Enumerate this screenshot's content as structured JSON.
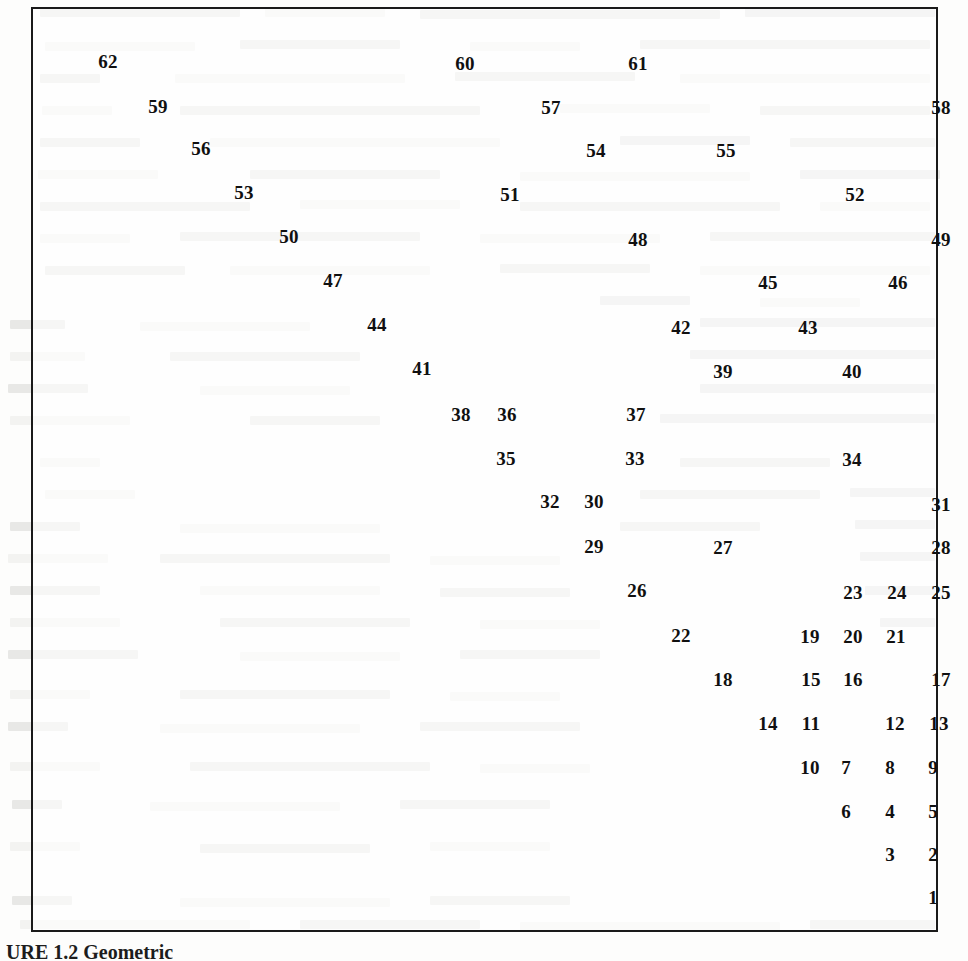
{
  "document": {
    "kind": "scanned-book-page",
    "figure_caption": "URE 1.2   Geometric"
  },
  "chart_data": {
    "type": "scatter",
    "title": "",
    "subtitle": "",
    "xlabel": "",
    "ylabel": "",
    "grid": false,
    "legend": null,
    "axis_ticks": [],
    "axis_visible": false,
    "frame": "full-box-border",
    "point_label_mode": "numeric-index",
    "n_points": 62,
    "xlim": [
      0,
      907
    ],
    "ylim": [
      0,
      925
    ],
    "note": "Each point is drawn only as its numeric index label; coordinates are label centers in pixels relative to the plot frame interior.",
    "points": [
      {
        "label": "62",
        "x": 75,
        "y": 52
      },
      {
        "label": "60",
        "x": 432,
        "y": 54
      },
      {
        "label": "61",
        "x": 605,
        "y": 54
      },
      {
        "label": "59",
        "x": 125,
        "y": 97
      },
      {
        "label": "57",
        "x": 518,
        "y": 98
      },
      {
        "label": "58",
        "x": 908,
        "y": 98
      },
      {
        "label": "56",
        "x": 168,
        "y": 139
      },
      {
        "label": "54",
        "x": 563,
        "y": 141
      },
      {
        "label": "55",
        "x": 693,
        "y": 141
      },
      {
        "label": "53",
        "x": 211,
        "y": 183
      },
      {
        "label": "51",
        "x": 477,
        "y": 185
      },
      {
        "label": "52",
        "x": 822,
        "y": 185
      },
      {
        "label": "50",
        "x": 256,
        "y": 227
      },
      {
        "label": "48",
        "x": 605,
        "y": 230
      },
      {
        "label": "49",
        "x": 908,
        "y": 230
      },
      {
        "label": "47",
        "x": 300,
        "y": 271
      },
      {
        "label": "45",
        "x": 735,
        "y": 273
      },
      {
        "label": "46",
        "x": 865,
        "y": 273
      },
      {
        "label": "44",
        "x": 344,
        "y": 315
      },
      {
        "label": "42",
        "x": 648,
        "y": 318
      },
      {
        "label": "43",
        "x": 775,
        "y": 318
      },
      {
        "label": "41",
        "x": 389,
        "y": 359
      },
      {
        "label": "39",
        "x": 690,
        "y": 362
      },
      {
        "label": "40",
        "x": 819,
        "y": 362
      },
      {
        "label": "38",
        "x": 428,
        "y": 405
      },
      {
        "label": "36",
        "x": 474,
        "y": 405
      },
      {
        "label": "37",
        "x": 603,
        "y": 405
      },
      {
        "label": "35",
        "x": 473,
        "y": 449
      },
      {
        "label": "33",
        "x": 602,
        "y": 449
      },
      {
        "label": "34",
        "x": 819,
        "y": 450
      },
      {
        "label": "32",
        "x": 517,
        "y": 492
      },
      {
        "label": "30",
        "x": 561,
        "y": 492
      },
      {
        "label": "31",
        "x": 908,
        "y": 495
      },
      {
        "label": "29",
        "x": 561,
        "y": 537
      },
      {
        "label": "27",
        "x": 690,
        "y": 538
      },
      {
        "label": "28",
        "x": 908,
        "y": 538
      },
      {
        "label": "26",
        "x": 604,
        "y": 581
      },
      {
        "label": "23",
        "x": 820,
        "y": 583
      },
      {
        "label": "24",
        "x": 864,
        "y": 583
      },
      {
        "label": "25",
        "x": 908,
        "y": 583
      },
      {
        "label": "22",
        "x": 648,
        "y": 626
      },
      {
        "label": "19",
        "x": 777,
        "y": 627
      },
      {
        "label": "20",
        "x": 820,
        "y": 627
      },
      {
        "label": "21",
        "x": 863,
        "y": 627
      },
      {
        "label": "18",
        "x": 690,
        "y": 670
      },
      {
        "label": "15",
        "x": 778,
        "y": 670
      },
      {
        "label": "16",
        "x": 820,
        "y": 670
      },
      {
        "label": "17",
        "x": 908,
        "y": 670
      },
      {
        "label": "14",
        "x": 735,
        "y": 714
      },
      {
        "label": "11",
        "x": 778,
        "y": 714
      },
      {
        "label": "12",
        "x": 862,
        "y": 714
      },
      {
        "label": "13",
        "x": 906,
        "y": 714
      },
      {
        "label": "10",
        "x": 777,
        "y": 758
      },
      {
        "label": "7",
        "x": 813,
        "y": 758
      },
      {
        "label": "8",
        "x": 857,
        "y": 758
      },
      {
        "label": "9",
        "x": 900,
        "y": 758
      },
      {
        "label": "6",
        "x": 813,
        "y": 802
      },
      {
        "label": "4",
        "x": 857,
        "y": 802
      },
      {
        "label": "5",
        "x": 900,
        "y": 802
      },
      {
        "label": "3",
        "x": 857,
        "y": 845
      },
      {
        "label": "2",
        "x": 900,
        "y": 845
      },
      {
        "label": "1",
        "x": 900,
        "y": 888
      }
    ]
  }
}
